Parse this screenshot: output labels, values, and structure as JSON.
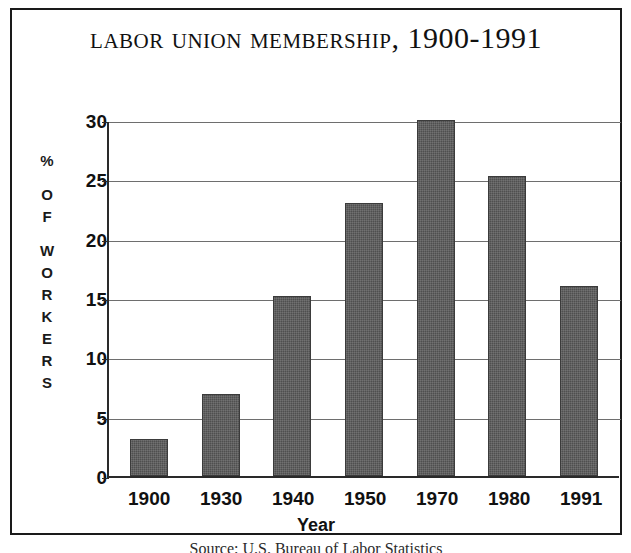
{
  "figure": {
    "title_main": "Labor Union Membership,",
    "title_range": " 1900-1991",
    "source_caption": "Source: U.S. Bureau of Labor Statistics"
  },
  "axes": {
    "y_caption_letters": [
      "%",
      "",
      "O",
      "F",
      "",
      "W",
      "O",
      "R",
      "K",
      "E",
      "R",
      "S"
    ],
    "y_caption_text": "% OF WORKERS",
    "x_title": "Year"
  },
  "chart_data": {
    "type": "bar",
    "title": "Labor Union Membership, 1900-1991",
    "xlabel": "Year",
    "ylabel": "% OF WORKERS",
    "categories": [
      "1900",
      "1930",
      "1940",
      "1950",
      "1970",
      "1980",
      "1991"
    ],
    "values": [
      3.1,
      6.9,
      15.2,
      23.0,
      30.0,
      25.3,
      16.0
    ],
    "ylim": [
      0,
      30
    ],
    "yticks": [
      0,
      5,
      10,
      15,
      20,
      25,
      30
    ],
    "ytick_labels": [
      "0",
      "5",
      "10",
      "15",
      "20",
      "25",
      "30"
    ],
    "grid": true,
    "legend": false,
    "bar_color": "#4f4f4f",
    "axis_color": "#2a2a2a",
    "gridline_color": "#6e6e6e",
    "background": "#ffffff"
  }
}
